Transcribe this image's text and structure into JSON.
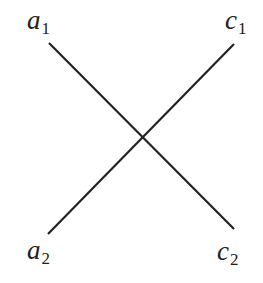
{
  "diagram": {
    "type": "crossing-lines",
    "stroke_color": "#222222",
    "labels": {
      "a1": {
        "base": "a",
        "sub": "1"
      },
      "c1": {
        "base": "c",
        "sub": "1"
      },
      "a2": {
        "base": "a",
        "sub": "2"
      },
      "c2": {
        "base": "c",
        "sub": "2"
      }
    },
    "lines": [
      {
        "from": "a1",
        "to": "c2"
      },
      {
        "from": "a2",
        "to": "c1"
      }
    ]
  }
}
